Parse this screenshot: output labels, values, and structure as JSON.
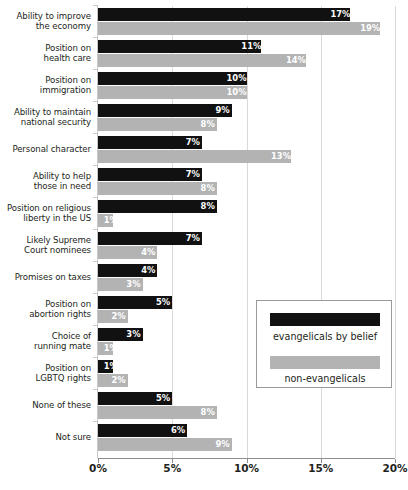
{
  "chart_data": {
    "type": "bar",
    "orientation": "horizontal",
    "title": "",
    "xlabel": "",
    "ylabel": "",
    "xlim": [
      0,
      20
    ],
    "xticks": [
      0,
      5,
      10,
      15,
      20
    ],
    "xtick_labels": [
      "0%",
      "5%",
      "10%",
      "15%",
      "20%"
    ],
    "grid": true,
    "grid_axis": "x",
    "legend_position": "inside-right",
    "value_suffix": "%",
    "categories": [
      "Ability to improve\nthe economy",
      "Position on\nhealth care",
      "Position on\nimmigration",
      "Ability to maintain\nnational security",
      "Personal character",
      "Ability to help\nthose in need",
      "Position on religious\nliberty in the US",
      "Likely Supreme\nCourt nominees",
      "Promises on taxes",
      "Position on\nabortion rights",
      "Choice of\nrunning mate",
      "Position on\nLGBTQ rights",
      "None of these",
      "Not sure"
    ],
    "series": [
      {
        "name": "evangelicals by belief",
        "color": "#111111",
        "values": [
          17,
          11,
          10,
          9,
          7,
          7,
          8,
          7,
          4,
          5,
          3,
          1,
          5,
          6
        ],
        "labels": [
          "17%",
          "11%",
          "10%",
          "9%",
          "7%",
          "7%",
          "8%",
          "7%",
          "4%",
          "5%",
          "3%",
          "1%",
          "5%",
          "6%"
        ]
      },
      {
        "name": "non-evangelicals",
        "color": "#b3b3b3",
        "values": [
          19,
          14,
          10,
          8,
          13,
          8,
          1,
          4,
          3,
          2,
          1,
          2,
          8,
          9
        ],
        "labels": [
          "19%",
          "14%",
          "10%",
          "8%",
          "13%",
          "8%",
          "1%",
          "4%",
          "3%",
          "2%",
          "1%",
          "2%",
          "8%",
          "9%"
        ]
      }
    ]
  },
  "legend": {
    "entries": [
      {
        "label": "evangelicals by belief",
        "color": "#111111"
      },
      {
        "label": "non-evangelicals",
        "color": "#b3b3b3"
      }
    ]
  },
  "colors": {
    "series_black": "#111111",
    "series_gray": "#b3b3b3",
    "gridline": "#d9d9d9",
    "axis": "#8e8e8e",
    "text": "#231f20",
    "background": "#ffffff"
  }
}
